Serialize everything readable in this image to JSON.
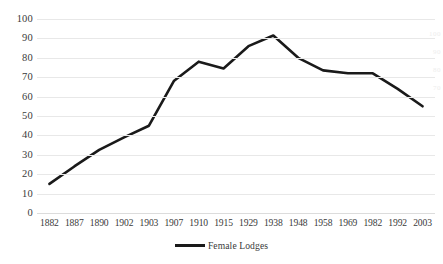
{
  "chart_data": {
    "type": "line",
    "title": "",
    "xlabel": "",
    "ylabel": "",
    "ylim": [
      0,
      100
    ],
    "ytick_step": 10,
    "grid": true,
    "legend_position": "bottom",
    "categories": [
      "1882",
      "1887",
      "1890",
      "1902",
      "1903",
      "1907",
      "1910",
      "1915",
      "1929",
      "1938",
      "1948",
      "1958",
      "1969",
      "1982",
      "1992",
      "2003"
    ],
    "yticks": [
      "0",
      "10",
      "20",
      "30",
      "40",
      "50",
      "60",
      "70",
      "80",
      "90",
      "100"
    ],
    "series": [
      {
        "name": "Female Lodges",
        "color": "#1a1a1a",
        "values": [
          15,
          24,
          32.5,
          39,
          45,
          68,
          78,
          74.5,
          86,
          91.5,
          80,
          73.5,
          72,
          72,
          64,
          55
        ]
      }
    ],
    "legend": [
      "Female Lodges"
    ]
  },
  "edge_artifacts": [
    "100",
    "90",
    "80",
    "70"
  ]
}
